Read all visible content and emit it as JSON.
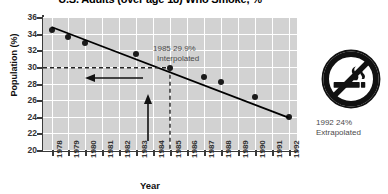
{
  "chart_data": {
    "type": "scatter",
    "title": "U.S. Adults (over age 18) Who Smoke, %",
    "xlabel": "Year",
    "ylabel": "Population (%)",
    "xlim": [
      1977.5,
      1992.5
    ],
    "ylim": [
      20,
      36
    ],
    "yticks": [
      20,
      22,
      24,
      26,
      28,
      30,
      32,
      34,
      36
    ],
    "xticks": [
      1978,
      1979,
      1980,
      1981,
      1982,
      1983,
      1984,
      1985,
      1986,
      1987,
      1988,
      1989,
      1990,
      1991,
      1992
    ],
    "grid": true,
    "legend": "none",
    "x": [
      1978,
      1979,
      1980,
      1983,
      1985,
      1987,
      1988,
      1990,
      1992
    ],
    "values": [
      34.5,
      33.6,
      32.9,
      31.6,
      29.9,
      28.8,
      28.2,
      26.4,
      24.0
    ],
    "series": [
      {
        "name": "Percent of U.S. adults who smoke",
        "points": [
          {
            "x": 1978,
            "y": 34.5,
            "kind": "observed"
          },
          {
            "x": 1979,
            "y": 33.6,
            "kind": "observed"
          },
          {
            "x": 1980,
            "y": 32.9,
            "kind": "observed"
          },
          {
            "x": 1983,
            "y": 31.6,
            "kind": "observed"
          },
          {
            "x": 1985,
            "y": 29.9,
            "kind": "interpolated"
          },
          {
            "x": 1987,
            "y": 28.8,
            "kind": "observed"
          },
          {
            "x": 1988,
            "y": 28.2,
            "kind": "observed"
          },
          {
            "x": 1990,
            "y": 26.4,
            "kind": "observed"
          },
          {
            "x": 1992,
            "y": 24.0,
            "kind": "extrapolated"
          }
        ]
      }
    ],
    "trendline": {
      "x0": 1978,
      "y0": 34.8,
      "x1": 1992,
      "y1": 23.9
    },
    "annotations": [
      {
        "name": "interpolated-callout",
        "line1": "1985 29.9%",
        "line2": "Interpolated",
        "x": 1985,
        "y": 29.9
      },
      {
        "name": "extrapolated-callout",
        "line1": "1992 24%",
        "line2": "Extrapolated",
        "x": 1992,
        "y": 24.0
      }
    ],
    "guides": [
      {
        "name": "horizontal-dashed-guide",
        "orientation": "horizontal",
        "value": 29.9
      },
      {
        "name": "vertical-dashed-guide",
        "orientation": "vertical",
        "value": 1985
      },
      {
        "name": "left-arrow",
        "orientation": "horizontal",
        "direction": "left"
      },
      {
        "name": "up-arrow",
        "orientation": "vertical",
        "direction": "up"
      }
    ],
    "colors": {
      "plot_background": "#d2d2d2",
      "gridline": "#ffffff",
      "marker": "#1a1a1a",
      "trendline": "#000000",
      "axis": "#3b3b3b",
      "annotation_text": "#4a4a4a",
      "title_text": "#000000"
    }
  },
  "icon": {
    "name": "no-smoking-icon",
    "description": "No smoking symbol"
  }
}
